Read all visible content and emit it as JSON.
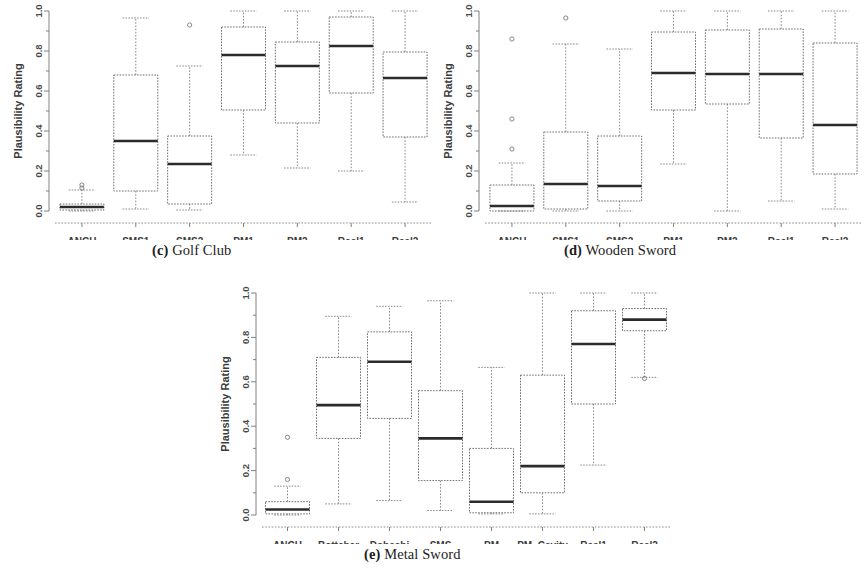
{
  "figure": {
    "axis_label_y": "Plausibility Rating",
    "y_ticks": [
      "0.0",
      "0.2",
      "0.4",
      "0.6",
      "0.8",
      "1.0"
    ],
    "colors": {
      "box_stroke": "#6e6e6e",
      "median_stroke": "#2b2b2b",
      "whisker_stroke": "#8a8a8a",
      "axis": "#808080",
      "text": "#3c3c3c",
      "background": "#ffffff"
    }
  },
  "chart_data": [
    {
      "type": "box",
      "panel": "c",
      "caption_prefix": "(c)",
      "caption_text": "Golf Club",
      "title": "(c) Golf Club",
      "xlabel": "",
      "ylabel": "Plausibility Rating",
      "ylim": [
        0.0,
        1.0
      ],
      "yticks": [
        0.0,
        0.2,
        0.4,
        0.6,
        0.8,
        1.0
      ],
      "grid": false,
      "categories": [
        "ANCH",
        "SMS1",
        "SMS2",
        "PM1",
        "PM2",
        "Real1",
        "Real2"
      ],
      "boxes": [
        {
          "label": "ANCH",
          "whisker_low": 0.0,
          "q1": 0.005,
          "median": 0.02,
          "q3": 0.035,
          "whisker_high": 0.105,
          "outliers": [
            0.115,
            0.13
          ]
        },
        {
          "label": "SMS1",
          "whisker_low": 0.01,
          "q1": 0.1,
          "median": 0.35,
          "q3": 0.68,
          "whisker_high": 0.965,
          "outliers": []
        },
        {
          "label": "SMS2",
          "whisker_low": 0.005,
          "q1": 0.035,
          "median": 0.235,
          "q3": 0.375,
          "whisker_high": 0.725,
          "outliers": [
            0.93
          ]
        },
        {
          "label": "PM1",
          "whisker_low": 0.28,
          "q1": 0.505,
          "median": 0.78,
          "q3": 0.92,
          "whisker_high": 1.0,
          "outliers": []
        },
        {
          "label": "PM2",
          "whisker_low": 0.215,
          "q1": 0.44,
          "median": 0.725,
          "q3": 0.845,
          "whisker_high": 1.0,
          "outliers": []
        },
        {
          "label": "Real1",
          "whisker_low": 0.2,
          "q1": 0.59,
          "median": 0.825,
          "q3": 0.97,
          "whisker_high": 1.0,
          "outliers": []
        },
        {
          "label": "Real2",
          "whisker_low": 0.045,
          "q1": 0.37,
          "median": 0.665,
          "q3": 0.795,
          "whisker_high": 1.0,
          "outliers": []
        }
      ]
    },
    {
      "type": "box",
      "panel": "d",
      "caption_prefix": "(d)",
      "caption_text": "Wooden Sword",
      "title": "(d) Wooden Sword",
      "xlabel": "",
      "ylabel": "Plausibility Rating",
      "ylim": [
        0.0,
        1.0
      ],
      "yticks": [
        0.0,
        0.2,
        0.4,
        0.6,
        0.8,
        1.0
      ],
      "grid": false,
      "categories": [
        "ANCH",
        "SMS1",
        "SMS2",
        "PM1",
        "PM2",
        "Real1",
        "Real2"
      ],
      "boxes": [
        {
          "label": "ANCH",
          "whisker_low": 0.0,
          "q1": 0.0,
          "median": 0.025,
          "q3": 0.13,
          "whisker_high": 0.24,
          "outliers": [
            0.31,
            0.46,
            0.86
          ]
        },
        {
          "label": "SMS1",
          "whisker_low": 0.0,
          "q1": 0.01,
          "median": 0.135,
          "q3": 0.395,
          "whisker_high": 0.835,
          "outliers": [
            0.965
          ]
        },
        {
          "label": "SMS2",
          "whisker_low": 0.0,
          "q1": 0.05,
          "median": 0.125,
          "q3": 0.375,
          "whisker_high": 0.81,
          "outliers": []
        },
        {
          "label": "PM1",
          "whisker_low": 0.235,
          "q1": 0.505,
          "median": 0.69,
          "q3": 0.895,
          "whisker_high": 1.0,
          "outliers": []
        },
        {
          "label": "PM2",
          "whisker_low": 0.0,
          "q1": 0.535,
          "median": 0.685,
          "q3": 0.905,
          "whisker_high": 1.0,
          "outliers": []
        },
        {
          "label": "Real1",
          "whisker_low": 0.05,
          "q1": 0.365,
          "median": 0.685,
          "q3": 0.91,
          "whisker_high": 1.0,
          "outliers": []
        },
        {
          "label": "Real2",
          "whisker_low": 0.01,
          "q1": 0.185,
          "median": 0.43,
          "q3": 0.84,
          "whisker_high": 1.0,
          "outliers": []
        }
      ]
    },
    {
      "type": "box",
      "panel": "e",
      "caption_prefix": "(e)",
      "caption_text": "Metal Sword",
      "title": "(e) Metal Sword",
      "xlabel": "",
      "ylabel": "Plausibility Rating",
      "ylim": [
        0.0,
        1.0
      ],
      "yticks": [
        0.0,
        0.2,
        0.4,
        0.6,
        0.8,
        1.0
      ],
      "grid": false,
      "categories": [
        "ANCH",
        "Bottcher",
        "Dobashi",
        "SMS",
        "PM",
        "PM_Cavity",
        "Real1",
        "Real2"
      ],
      "boxes": [
        {
          "label": "ANCH",
          "whisker_low": 0.0,
          "q1": 0.005,
          "median": 0.025,
          "q3": 0.06,
          "whisker_high": 0.13,
          "outliers": [
            0.16,
            0.35
          ]
        },
        {
          "label": "Bottcher",
          "whisker_low": 0.05,
          "q1": 0.345,
          "median": 0.495,
          "q3": 0.71,
          "whisker_high": 0.895,
          "outliers": []
        },
        {
          "label": "Dobashi",
          "whisker_low": 0.065,
          "q1": 0.435,
          "median": 0.69,
          "q3": 0.825,
          "whisker_high": 0.94,
          "outliers": []
        },
        {
          "label": "SMS",
          "whisker_low": 0.02,
          "q1": 0.155,
          "median": 0.345,
          "q3": 0.56,
          "whisker_high": 0.965,
          "outliers": []
        },
        {
          "label": "PM",
          "whisker_low": 0.005,
          "q1": 0.01,
          "median": 0.06,
          "q3": 0.3,
          "whisker_high": 0.665,
          "outliers": []
        },
        {
          "label": "PM_Cavity",
          "whisker_low": 0.005,
          "q1": 0.1,
          "median": 0.22,
          "q3": 0.63,
          "whisker_high": 1.0,
          "outliers": []
        },
        {
          "label": "Real1",
          "whisker_low": 0.225,
          "q1": 0.5,
          "median": 0.77,
          "q3": 0.92,
          "whisker_high": 1.0,
          "outliers": []
        },
        {
          "label": "Real2",
          "whisker_low": 0.62,
          "q1": 0.83,
          "median": 0.88,
          "q3": 0.93,
          "whisker_high": 1.0,
          "outliers": [
            0.615
          ]
        }
      ]
    }
  ]
}
